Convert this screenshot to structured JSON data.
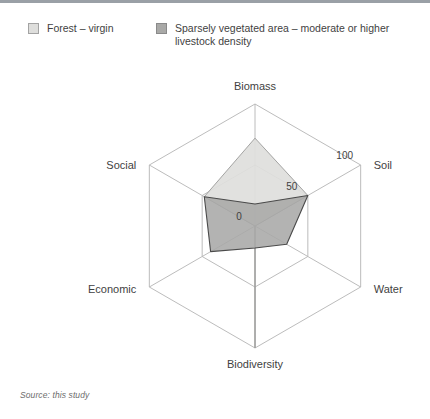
{
  "figure": {
    "background": "#ffffff",
    "source_note": "Source: this study"
  },
  "legend": {
    "items": [
      {
        "label": "Forest – virgin",
        "color": "#dededc",
        "border": "#a3a3a3",
        "swatch_name": "legend-swatch-forest-virgin"
      },
      {
        "label": "Sparsely vegetated area – moderate or higher\nlivestock density",
        "color": "#a9a9a7",
        "border": "#8a8a8a",
        "swatch_name": "legend-swatch-sparsely-vegetated"
      }
    ]
  },
  "chart_data": {
    "type": "radar",
    "title": "",
    "categories": [
      "Biomass",
      "Soil",
      "Water",
      "Biodiversity",
      "Economic",
      "Social"
    ],
    "ticks": [
      "0",
      "50",
      "100"
    ],
    "rmin": 0,
    "rmax": 100,
    "grid": true,
    "grid_shape": "hexagon",
    "grid_rings": [
      0,
      50,
      100
    ],
    "legend_position": "top",
    "tick_axis": "Soil",
    "series": [
      {
        "name": "Forest – virgin",
        "color": "#dededc",
        "stroke": "#9a9a98",
        "values": [
          72,
          50,
          0,
          100,
          0,
          48
        ]
      },
      {
        "name": "Sparsely vegetated area – moderate or higher livestock density",
        "color": "#a9a9a7",
        "stroke": "#4a4a4a",
        "values": [
          18,
          50,
          30,
          18,
          42,
          48
        ]
      }
    ],
    "axis_label_positions": {
      "Biomass": "top",
      "Soil": "upper-right",
      "Water": "lower-right",
      "Biodiversity": "bottom",
      "Economic": "lower-left",
      "Social": "upper-left"
    }
  },
  "axis_labels": {
    "biomass": "Biomass",
    "soil": "Soil",
    "water": "Water",
    "biodiversity": "Biodiversity",
    "economic": "Economic",
    "social": "Social"
  },
  "tick_labels": {
    "zero": "0",
    "fifty": "50",
    "hundred": "100"
  }
}
